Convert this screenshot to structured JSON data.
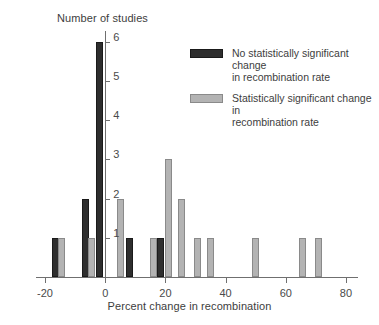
{
  "chart_data": {
    "type": "bar",
    "title": "",
    "xlabel": "Percent change in recombination",
    "ylabel": "Number of studies",
    "xlim": [
      -23,
      84
    ],
    "ylim": [
      0,
      6.3
    ],
    "xticks": [
      -20,
      0,
      20,
      40,
      60,
      80
    ],
    "yticks": [
      1,
      2,
      3,
      4,
      5,
      6
    ],
    "grid": false,
    "legend_position": "upper-right",
    "series": [
      {
        "name": "No statistically significant change in recombination rate",
        "color": "#2e2e2e",
        "points": [
          {
            "x": -16.5,
            "y": 1
          },
          {
            "x": -6.5,
            "y": 2
          },
          {
            "x": -2.0,
            "y": 6
          },
          {
            "x": 8.0,
            "y": 1
          },
          {
            "x": 18.5,
            "y": 1
          }
        ]
      },
      {
        "name": "Statistically significant change in recombination rate",
        "color": "#b3b3b3",
        "points": [
          {
            "x": -14.5,
            "y": 1
          },
          {
            "x": -4.5,
            "y": 1
          },
          {
            "x": 5.0,
            "y": 2
          },
          {
            "x": 16.0,
            "y": 1
          },
          {
            "x": 21.0,
            "y": 3
          },
          {
            "x": 25.5,
            "y": 2
          },
          {
            "x": 30.5,
            "y": 1
          },
          {
            "x": 35.0,
            "y": 1
          },
          {
            "x": 50.0,
            "y": 1
          },
          {
            "x": 65.5,
            "y": 1
          },
          {
            "x": 71.0,
            "y": 1
          }
        ]
      }
    ]
  },
  "axes": {
    "y_title": "Number of studies",
    "x_title": "Percent change in recombination",
    "x_tick_labels": [
      "-20",
      "0",
      "20",
      "40",
      "60",
      "80"
    ],
    "y_tick_labels": [
      "1",
      "2",
      "3",
      "4",
      "5",
      "6"
    ]
  },
  "legend": {
    "entries": [
      {
        "swatch": "dark",
        "line1": "No statistically significant change",
        "line2": "in recombination rate"
      },
      {
        "swatch": "light",
        "line1": "Statistically significant change in",
        "line2": "recombination rate"
      }
    ]
  }
}
